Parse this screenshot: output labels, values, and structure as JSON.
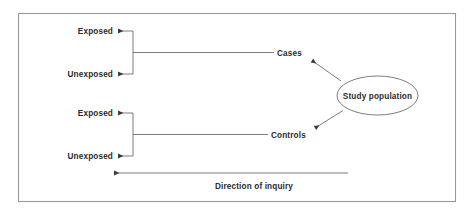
{
  "diagram": {
    "colors": {
      "line": "#6e6e6e",
      "text": "#2b2b2b",
      "border": "#9a9a9a",
      "background": "#ffffff"
    },
    "groups": [
      {
        "id": "cases-group",
        "outcome_label": "Cases",
        "exposed_label": "Exposed",
        "unexposed_label": "Unexposed"
      },
      {
        "id": "controls-group",
        "outcome_label": "Controls",
        "exposed_label": "Exposed",
        "unexposed_label": "Unexposed"
      }
    ],
    "source_node": {
      "label": "Study population",
      "shape": "ellipse"
    },
    "caption": "Direction of inquiry"
  }
}
